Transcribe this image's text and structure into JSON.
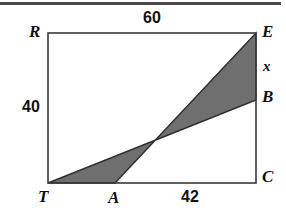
{
  "figure": {
    "type": "geometry-diagram",
    "background_color": "#ffffff",
    "outline_color": "#3a3a3a",
    "shaded_fill_color": "#706f70",
    "top_rule_color": "#4a4a4a",
    "rectangle": {
      "vertices": [
        {
          "label": "R",
          "x": 48,
          "y": 33
        },
        {
          "label": "E",
          "x": 256,
          "y": 33
        },
        {
          "label": "C",
          "x": 256,
          "y": 183
        },
        {
          "label": "T",
          "x": 48,
          "y": 183
        }
      ]
    },
    "shaded_polygon": {
      "name": "parallelogram-TAEB",
      "points": "48,183 115,183 256,33 256,100"
    },
    "interior_points": [
      {
        "label": "A",
        "x": 115,
        "y": 183
      },
      {
        "label": "B",
        "x": 256,
        "y": 100
      }
    ]
  },
  "labels": {
    "vertex_r": "R",
    "vertex_e": "E",
    "vertex_b": "B",
    "vertex_c": "C",
    "vertex_t": "T",
    "vertex_a": "A",
    "measure_top": "60",
    "measure_left": "40",
    "measure_bottom": "42",
    "measure_x": "x"
  }
}
